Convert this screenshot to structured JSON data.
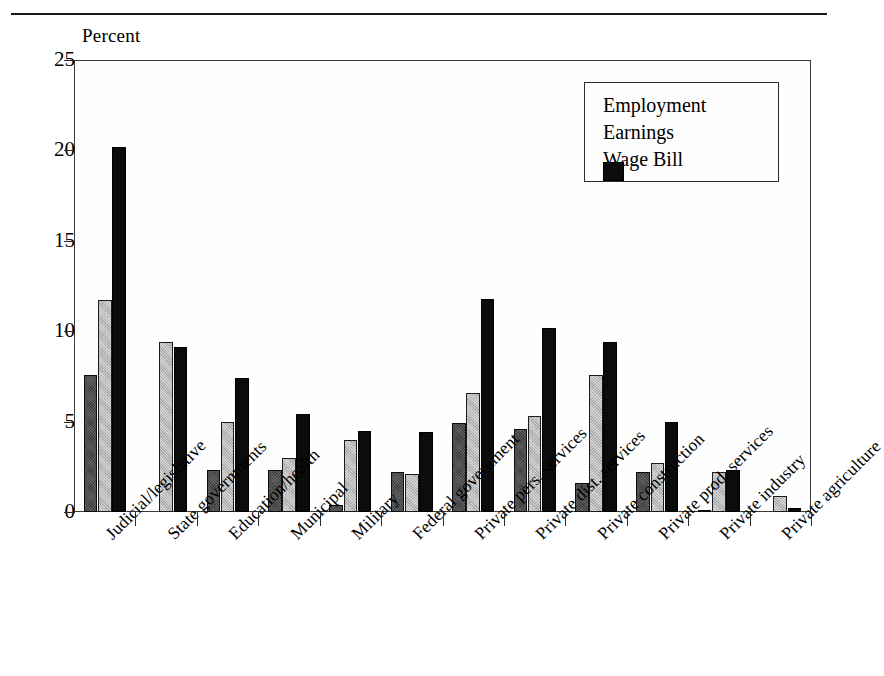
{
  "figure": {
    "axis_unit_label": "Percent",
    "clipped_header_text": ""
  },
  "legend": {
    "position": "top-right-inside",
    "entries": [
      {
        "label": "Employment",
        "color": "#3a3a3a",
        "swatch": "employment-swatch"
      },
      {
        "label": "Earnings",
        "color": "#b5b5b5",
        "swatch": "earnings-swatch"
      },
      {
        "label": "Wage Bill",
        "color": "#0c0c0c",
        "swatch": "wagebill-swatch"
      }
    ]
  },
  "chart_data": {
    "type": "bar",
    "title": "",
    "subtitle": "",
    "xlabel": "",
    "ylabel": "Percent",
    "ylim": [
      0,
      25
    ],
    "ytick_values": [
      0,
      5,
      10,
      15,
      20,
      25
    ],
    "ytick_labels": [
      "0",
      "5",
      "10",
      "15",
      "20",
      "25"
    ],
    "grid": false,
    "legend_position": "upper right",
    "orientation": "vertical",
    "grouped": true,
    "categories": [
      "Judicial/legislative",
      "State governments",
      "Education/health",
      "Municipal",
      "Military",
      "Federal government",
      "Private pers. services",
      "Private dist. services",
      "Private construction",
      "Private prod. services",
      "Private industry",
      "Private agriculture"
    ],
    "series": [
      {
        "name": "Employment",
        "color": "#3a3a3a",
        "values": [
          7.6,
          0.0,
          2.3,
          2.3,
          0.4,
          2.2,
          4.9,
          4.6,
          1.6,
          2.2,
          0.1,
          0.0
        ]
      },
      {
        "name": "Earnings",
        "color": "#b5b5b5",
        "values": [
          11.7,
          9.4,
          5.0,
          3.0,
          4.0,
          2.1,
          6.6,
          5.3,
          7.6,
          2.7,
          2.2,
          0.9
        ]
      },
      {
        "name": "Wage Bill",
        "color": "#0c0c0c",
        "values": [
          20.2,
          9.1,
          7.4,
          5.4,
          4.5,
          4.4,
          11.8,
          10.2,
          9.4,
          5.0,
          2.3,
          0.2
        ]
      }
    ]
  }
}
